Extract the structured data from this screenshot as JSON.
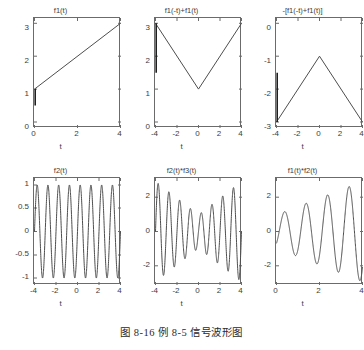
{
  "figure": {
    "caption": "图 8-16  例 8-5 信号波形图",
    "line_color": "#4d4d4d",
    "axis_color": "#6b6b6b",
    "background": "#ffffff"
  },
  "chart_data": [
    {
      "type": "line",
      "panel": "top-left",
      "title": "f1(t)",
      "xlabel": "t",
      "ylabel": "",
      "xlim": [
        0,
        4
      ],
      "ylim": [
        -0.15,
        3.2
      ],
      "xticks": [
        0,
        2,
        4
      ],
      "xticklabels": [
        "0",
        "2",
        "4"
      ],
      "yticks": [
        0,
        1,
        2,
        3
      ],
      "yticklabels": [
        "0",
        "1",
        "2",
        "3"
      ],
      "grid": false,
      "legend": null,
      "series": [
        {
          "name": "f1(t) = 1 + t/2",
          "x": [
            0,
            4
          ],
          "values": [
            1,
            3
          ]
        },
        {
          "name": "step-edge at t=0",
          "x": [
            0,
            0
          ],
          "values": [
            0.5,
            1
          ]
        }
      ]
    },
    {
      "type": "line",
      "panel": "top-middle",
      "title": "f1(-t)+f1(t)",
      "xlabel": "t",
      "ylabel": "",
      "xlim": [
        -4,
        4
      ],
      "ylim": [
        -0.15,
        3.2
      ],
      "xticks": [
        -4,
        -2,
        0,
        2,
        4
      ],
      "xticklabels": [
        "-4",
        "-2",
        "0",
        "2",
        "4"
      ],
      "yticks": [
        0,
        1,
        2,
        3
      ],
      "yticklabels": [
        "0",
        "1",
        "2",
        "3"
      ],
      "grid": false,
      "legend": null,
      "series": [
        {
          "name": "V-shape 1+|t|/2",
          "x": [
            -4,
            0,
            4
          ],
          "values": [
            3,
            1,
            3
          ]
        },
        {
          "name": "step-edge at t=-4",
          "x": [
            -4,
            -4
          ],
          "values": [
            1.5,
            3
          ]
        }
      ]
    },
    {
      "type": "line",
      "panel": "top-right",
      "title": "-[f1(-t)+f1(t)]",
      "xlabel": "t",
      "ylabel": "",
      "xlim": [
        -4,
        4
      ],
      "ylim": [
        -3.2,
        0.15
      ],
      "xticks": [
        -4,
        -2,
        0,
        2,
        4
      ],
      "xticklabels": [
        "-4",
        "-2",
        "0",
        "2",
        "4"
      ],
      "yticks": [
        0,
        -1,
        -2,
        -3
      ],
      "yticklabels": [
        "0",
        "-1",
        "-2",
        "-3"
      ],
      "grid": false,
      "legend": null,
      "series": [
        {
          "name": "inverted V -(1+|t|/2)",
          "x": [
            -4,
            0,
            4
          ],
          "values": [
            -3,
            -1,
            -3
          ]
        },
        {
          "name": "step-edge at t=-4",
          "x": [
            -4,
            -4
          ],
          "values": [
            -3,
            -1.5
          ]
        }
      ]
    },
    {
      "type": "line",
      "panel": "bottom-left",
      "title": "f2(t)",
      "xlabel": "t",
      "ylabel": "",
      "xlim": [
        -4,
        4
      ],
      "ylim": [
        -1.15,
        1.15
      ],
      "xticks": [
        -4,
        -2,
        0,
        2,
        4
      ],
      "xticklabels": [
        "-4",
        "-2",
        "0",
        "2",
        "4"
      ],
      "yticks": [
        -1,
        -0.5,
        0,
        0.5,
        1
      ],
      "yticklabels": [
        "-1",
        "-0.5",
        "0",
        "0.5",
        "1"
      ],
      "grid": false,
      "legend": null,
      "series": [
        {
          "name": "f2(t) = sin(2*pi*t)",
          "formula": "sin(2*pi*t)",
          "amplitude": 1,
          "cycles": 8
        }
      ]
    },
    {
      "type": "line",
      "panel": "bottom-middle",
      "title": "f2(t)*f3(t)",
      "xlabel": "t",
      "ylabel": "",
      "xlim": [
        -4,
        4
      ],
      "ylim": [
        -3.2,
        3.2
      ],
      "xticks": [
        -4,
        -2,
        0,
        2,
        4
      ],
      "xticklabels": [
        "-4",
        "-2",
        "0",
        "2",
        "4"
      ],
      "yticks": [
        -2,
        0,
        2
      ],
      "yticklabels": [
        "-2",
        "0",
        "2"
      ],
      "grid": false,
      "legend": null,
      "series": [
        {
          "name": "f2(t)*f3(t) = (1+|t|/2)*sin(2*pi*t)",
          "formula": "(1+abs(t)/2)*sin(2*pi*t)",
          "envelope_min": 1,
          "envelope_max": 3,
          "cycles": 8
        }
      ]
    },
    {
      "type": "line",
      "panel": "bottom-right",
      "title": "f1(t)*f2(t)",
      "xlabel": "t",
      "ylabel": "",
      "xlim": [
        0,
        4
      ],
      "ylim": [
        -3.2,
        3.2
      ],
      "xticks": [
        0,
        2,
        4
      ],
      "xticklabels": [
        "0",
        "2",
        "4"
      ],
      "yticks": [
        -2,
        0,
        2
      ],
      "yticklabels": [
        "-2",
        "0",
        "2"
      ],
      "grid": false,
      "legend": null,
      "series": [
        {
          "name": "f1(t)*f2(t) = (1+t/2)*sin(2*pi*t)",
          "formula": "(1+t/2)*sin(2*pi*t)",
          "envelope_min": 1,
          "envelope_max": 3,
          "cycles": 4
        }
      ]
    }
  ]
}
